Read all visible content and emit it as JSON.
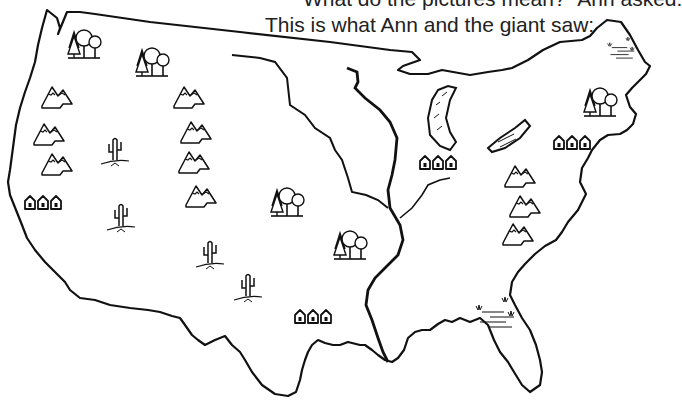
{
  "caption": {
    "line1": "“What do the pictures mean?” Ann asked.",
    "line2": "This is what Ann and the giant saw:"
  },
  "map": {
    "subject": "outline map of the United States with picture symbols",
    "colors": {
      "ink": "#111111",
      "paper": "#ffffff"
    },
    "symbols": [
      {
        "type": "forest",
        "region": "northwest",
        "x": 82,
        "y": 42
      },
      {
        "type": "forest",
        "region": "northern-rockies",
        "x": 150,
        "y": 60
      },
      {
        "type": "forest",
        "region": "plains",
        "x": 285,
        "y": 200
      },
      {
        "type": "forest",
        "region": "midwest",
        "x": 348,
        "y": 243
      },
      {
        "type": "forest",
        "region": "northeast",
        "x": 598,
        "y": 110
      },
      {
        "type": "mountains",
        "region": "west-coast",
        "x": 57,
        "y": 96
      },
      {
        "type": "mountains",
        "region": "west-coast",
        "x": 49,
        "y": 133
      },
      {
        "type": "mountains",
        "region": "west-coast",
        "x": 57,
        "y": 163
      },
      {
        "type": "mountains",
        "region": "rockies",
        "x": 189,
        "y": 96
      },
      {
        "type": "mountains",
        "region": "rockies",
        "x": 196,
        "y": 131
      },
      {
        "type": "mountains",
        "region": "rockies",
        "x": 194,
        "y": 161
      },
      {
        "type": "mountains",
        "region": "rockies",
        "x": 201,
        "y": 195
      },
      {
        "type": "mountains",
        "region": "appalachians",
        "x": 520,
        "y": 175
      },
      {
        "type": "mountains",
        "region": "appalachians",
        "x": 525,
        "y": 205
      },
      {
        "type": "mountains",
        "region": "appalachians",
        "x": 518,
        "y": 233
      },
      {
        "type": "cactus",
        "region": "great-basin",
        "x": 115,
        "y": 155
      },
      {
        "type": "cactus",
        "region": "southwest",
        "x": 121,
        "y": 218
      },
      {
        "type": "cactus",
        "region": "southwest",
        "x": 210,
        "y": 255
      },
      {
        "type": "cactus",
        "region": "southwest",
        "x": 248,
        "y": 288
      },
      {
        "type": "city",
        "region": "california",
        "x": 43,
        "y": 203
      },
      {
        "type": "city",
        "region": "texas",
        "x": 313,
        "y": 317
      },
      {
        "type": "city",
        "region": "chicago",
        "x": 438,
        "y": 163
      },
      {
        "type": "city",
        "region": "east-coast",
        "x": 572,
        "y": 143
      },
      {
        "type": "swamp",
        "region": "florida",
        "x": 500,
        "y": 320
      },
      {
        "type": "lake",
        "region": "great-lakes",
        "x": 440,
        "y": 100
      },
      {
        "type": "lake",
        "region": "great-lakes",
        "x": 510,
        "y": 145
      },
      {
        "type": "swamp",
        "region": "maine",
        "x": 625,
        "y": 55
      }
    ]
  }
}
